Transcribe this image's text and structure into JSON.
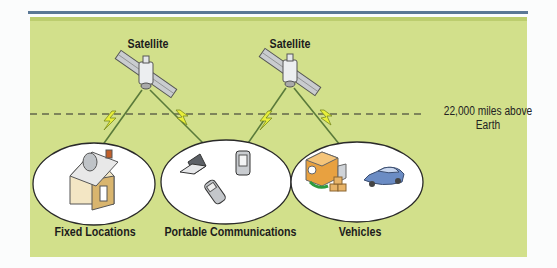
{
  "diagram": {
    "satellites": [
      {
        "label": "Satellite"
      },
      {
        "label": "Satellite"
      }
    ],
    "altitude_line": {
      "line1": "22,000 miles above",
      "line2": "Earth"
    },
    "groups": [
      {
        "label": "Fixed Locations",
        "icons": [
          "house-with-dish"
        ]
      },
      {
        "label": "Portable Communications",
        "icons": [
          "laptop",
          "pda",
          "cell-phone"
        ]
      },
      {
        "label": "Vehicles",
        "icons": [
          "delivery-truck",
          "boxes",
          "car"
        ]
      }
    ],
    "colors": {
      "background": "#d2e08b",
      "rule": "#5b7896",
      "signal": "#e8ef3a",
      "beam": "#5a7a3a"
    }
  }
}
